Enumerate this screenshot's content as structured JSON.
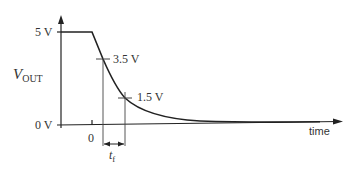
{
  "diagram": {
    "y_axis": {
      "label_main": "V",
      "label_sub": "OUT",
      "tick_high": "5 V",
      "tick_low": "0 V"
    },
    "x_axis": {
      "label": "time",
      "tick_zero": "0"
    },
    "markers": {
      "upper": "3.5 V",
      "lower": "1.5 V"
    },
    "interval": {
      "label_main": "t",
      "label_sub": "f"
    },
    "colors": {
      "line": "#222222",
      "text": "#333333",
      "background": "#ffffff"
    }
  }
}
